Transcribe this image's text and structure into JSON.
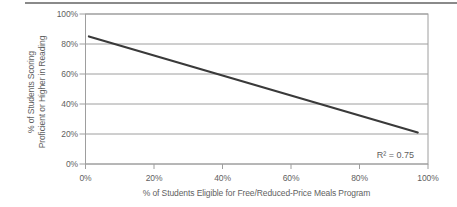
{
  "chart_data": {
    "type": "line",
    "title": "",
    "xlabel": "% of Students Eligible for Free/Reduced-Price Meals Program",
    "ylabel_lines": [
      "% of Students Scoring",
      "Proficient or Higher in Reading"
    ],
    "annotation": "R² = 0.75",
    "xlim": [
      0,
      100
    ],
    "ylim": [
      0,
      100
    ],
    "grid": "horizontal",
    "legend": "none",
    "xticks": [
      {
        "value": 0,
        "label": "0%"
      },
      {
        "value": 20,
        "label": "20%"
      },
      {
        "value": 40,
        "label": "40%"
      },
      {
        "value": 60,
        "label": "60%"
      },
      {
        "value": 80,
        "label": "80%"
      },
      {
        "value": 100,
        "label": "100%"
      }
    ],
    "yticks": [
      {
        "value": 0,
        "label": "0%"
      },
      {
        "value": 20,
        "label": "20%"
      },
      {
        "value": 40,
        "label": "40%"
      },
      {
        "value": 60,
        "label": "60%"
      },
      {
        "value": 80,
        "label": "80%"
      },
      {
        "value": 100,
        "label": "100%"
      }
    ],
    "series": [
      {
        "name": "regression-trend-line",
        "points": [
          {
            "x": 1,
            "y": 85
          },
          {
            "x": 97,
            "y": 21
          }
        ]
      }
    ],
    "colors": {
      "grid": "#9e9e9e",
      "line": "#3a3a3a",
      "text": "#5f5f5f",
      "top_rule": "#8a8a8a"
    }
  }
}
